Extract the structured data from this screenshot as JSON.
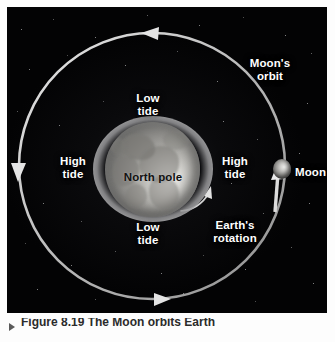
{
  "figure": {
    "domain": "diagram",
    "background_color": "#050506",
    "panel": {
      "left": 7,
      "top": 7,
      "width": 320,
      "height": 306
    }
  },
  "labels": {
    "moons_orbit": "Moon's\norbit",
    "low_tide_top": "Low\ntide",
    "high_tide_left": "High\ntide",
    "north_pole": "North pole",
    "high_tide_right": "High\ntide",
    "low_tide_bottom": "Low\ntide",
    "earths_rotation": "Earth's\nrotation",
    "moon": "Moon"
  },
  "caption": {
    "text": "Figure 8.19  The Moon orbits Earth"
  },
  "bodies": {
    "earth": {
      "name": "Earth",
      "center_x": 146,
      "center_y": 166,
      "radius": 48,
      "surface": "grayscale globe showing North America, viewed from above the north pole"
    },
    "tidal_bulge": {
      "name": "tidal bulge",
      "center_x": 146,
      "center_y": 166,
      "radius_x": 60,
      "radius_y": 53,
      "color": "#b2b2b4"
    },
    "moon": {
      "name": "Moon",
      "center_x": 282,
      "center_y": 169,
      "radius": 10
    }
  },
  "arrows": {
    "orbit_top": {
      "name": "orbit-arrow-top",
      "direction": "left",
      "x": 148,
      "y": 33
    },
    "orbit_left": {
      "name": "orbit-arrow-left",
      "direction": "down",
      "x": 16,
      "y": 170
    },
    "orbit_bottom": {
      "name": "orbit-arrow-bottom",
      "direction": "right",
      "x": 150,
      "y": 300
    },
    "orbit_moon": {
      "name": "orbit-arrow-moon",
      "direction": "up",
      "x": 274,
      "y": 186
    },
    "earth_rotation": {
      "name": "earth-rotation-arrow",
      "direction": "counterclockwise",
      "x": 207,
      "y": 190
    }
  },
  "colors": {
    "sky": "#050506",
    "orbit_line": "#cfcfcf",
    "label_text": "#ffffff",
    "dark_label_text": "#121212",
    "earth_highlight": "#f2f2f0",
    "moon_highlight": "#eeeeec",
    "caption_text": "#2b2b2b"
  },
  "orbit": {
    "name": "moon-orbit-path",
    "center_x": 152,
    "center_y": 166,
    "radius_x": 133,
    "radius_y": 135,
    "stroke_width": 2.4
  }
}
